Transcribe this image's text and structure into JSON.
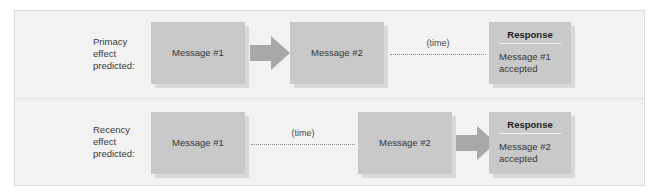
{
  "figure": {
    "background_color": "#ffffff",
    "panel_color": "#f2f2f2",
    "box_color": "#c9c9c9",
    "shadow_color": "#d9d9d9",
    "arrow_color": "#a8a8a8",
    "text_color": "#33383c"
  },
  "rows": [
    {
      "id": "primacy",
      "label": "Primacy\neffect\npredicted:",
      "first_message": "Message #1",
      "arrow_after_first": true,
      "second_message": "Message #2",
      "time_label": "(time)",
      "time_position": "after-second-message",
      "arrow_after_second": false,
      "response": {
        "title": "Response",
        "body": "Message #1\naccepted"
      }
    },
    {
      "id": "recency",
      "label": "Recency\neffect\npredicted:",
      "first_message": "Message #1",
      "arrow_after_first": false,
      "second_message": "Message #2",
      "time_label": "(time)",
      "time_position": "after-first-message",
      "arrow_after_second": true,
      "response": {
        "title": "Response",
        "body": "Message #2\naccepted"
      }
    }
  ]
}
